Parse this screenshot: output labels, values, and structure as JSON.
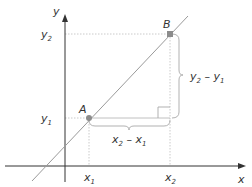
{
  "diagram": {
    "colors": {
      "axis": "#333333",
      "line": "#9a9a9a",
      "guide": "#b8b8b8",
      "point": "#8c8c8c",
      "bracket": "#a8a8a8",
      "text": "#333333"
    },
    "axes": {
      "x_label": "x",
      "y_label": "y"
    },
    "points": [
      {
        "name": "A",
        "label": "A",
        "x_label": "x",
        "x_sub": "1",
        "y_label": "y",
        "y_sub": "1"
      },
      {
        "name": "B",
        "label": "B",
        "x_label": "x",
        "x_sub": "2",
        "y_label": "y",
        "y_sub": "2"
      }
    ],
    "brackets": {
      "horizontal": {
        "main1": "x",
        "sub1": "2",
        "op": " – ",
        "main2": "x",
        "sub2": "1"
      },
      "vertical": {
        "main1": "y",
        "sub1": "2",
        "op": " – ",
        "main2": "y",
        "sub2": "1"
      }
    }
  }
}
